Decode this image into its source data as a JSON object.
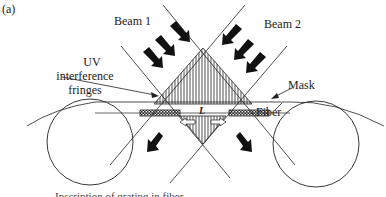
{
  "figure": {
    "panel_label": "(a)",
    "labels": {
      "beam1": "Beam 1",
      "beam2": "Beam 2",
      "uv_line1": "UV",
      "uv_line2": "interference",
      "uv_line3": "fringes",
      "mask": "Mask",
      "fiber": "Fiber",
      "length_symbol": "L",
      "caption_truncated": "Inscription of grating in fiber"
    },
    "colors": {
      "line": "#222222",
      "arrow": "#111111",
      "background": "#ffffff"
    }
  }
}
